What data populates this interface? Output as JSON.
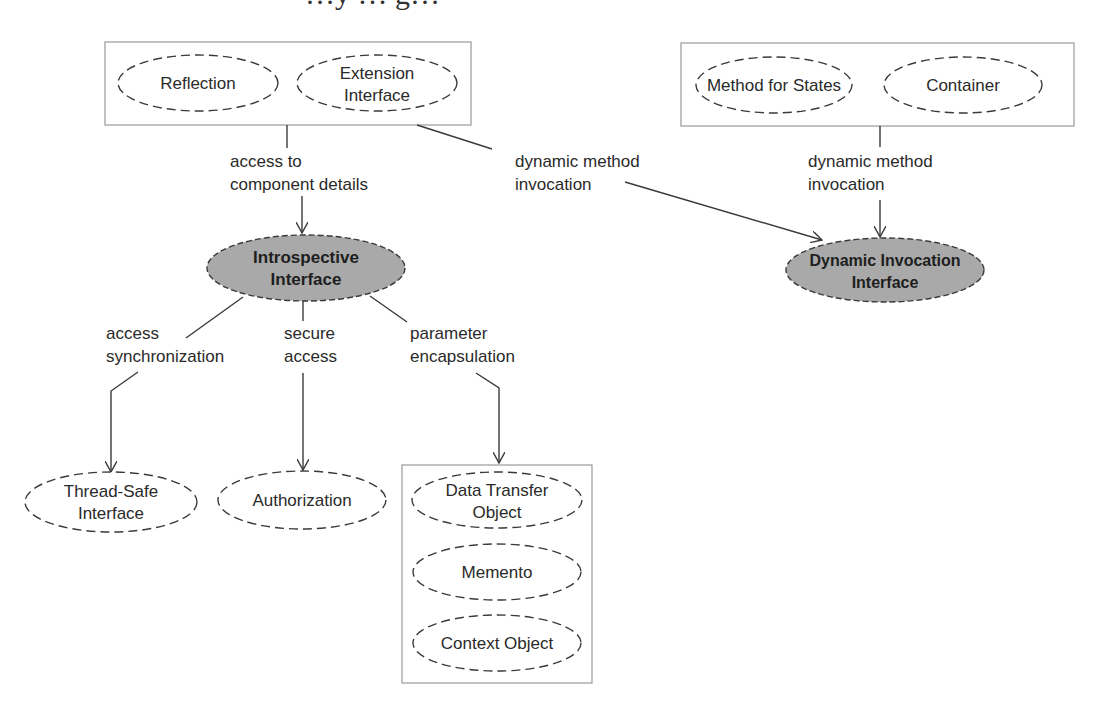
{
  "title": {
    "text": "…y … g…",
    "note": "cropped serif heading at top edge (only descenders visible)"
  },
  "colors": {
    "background": "#ffffff",
    "stroke": "#3a3a3a",
    "box_stroke": "#9a9a9a",
    "highlight_fill": "#a9a9a9",
    "text": "#2a2a2a"
  },
  "groups": [
    {
      "id": "group-top-left",
      "nodes": [
        "Reflection",
        "Extension Interface"
      ]
    },
    {
      "id": "group-top-right",
      "nodes": [
        "Method for States",
        "Container"
      ]
    },
    {
      "id": "group-bottom-right",
      "nodes": [
        "Data Transfer Object",
        "Memento",
        "Context Object"
      ]
    }
  ],
  "nodes": {
    "reflection": {
      "lines": [
        "Reflection"
      ]
    },
    "extension_interface": {
      "lines": [
        "Extension",
        "Interface"
      ]
    },
    "method_for_states": {
      "lines": [
        "Method for States"
      ]
    },
    "container": {
      "lines": [
        "Container"
      ]
    },
    "introspective_interface": {
      "lines": [
        "Introspective",
        "Interface"
      ],
      "highlighted": true
    },
    "dynamic_invocation_interface": {
      "lines": [
        "Dynamic Invocation",
        "Interface"
      ],
      "highlighted": true
    },
    "thread_safe_interface": {
      "lines": [
        "Thread-Safe",
        "Interface"
      ]
    },
    "authorization": {
      "lines": [
        "Authorization"
      ]
    },
    "data_transfer_object": {
      "lines": [
        "Data Transfer",
        "Object"
      ]
    },
    "memento": {
      "lines": [
        "Memento"
      ]
    },
    "context_object": {
      "lines": [
        "Context Object"
      ]
    }
  },
  "edges": [
    {
      "from": "group-top-left",
      "to": "introspective_interface",
      "label": [
        "access to",
        "component details"
      ]
    },
    {
      "from": "group-top-left",
      "to": "dynamic_invocation_interface",
      "label": [
        "dynamic method",
        "invocation"
      ]
    },
    {
      "from": "group-top-right",
      "to": "dynamic_invocation_interface",
      "label": [
        "dynamic method",
        "invocation"
      ]
    },
    {
      "from": "introspective_interface",
      "to": "thread_safe_interface",
      "label": [
        "access",
        "synchronization"
      ]
    },
    {
      "from": "introspective_interface",
      "to": "authorization",
      "label": [
        "secure",
        "access"
      ]
    },
    {
      "from": "introspective_interface",
      "to": "group-bottom-right",
      "label": [
        "parameter",
        "encapsulation"
      ]
    }
  ]
}
